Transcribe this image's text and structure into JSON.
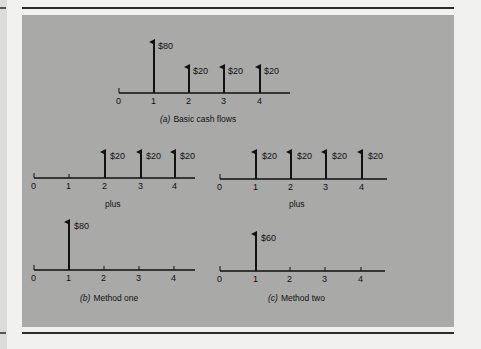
{
  "colors": {
    "panel": "#a9a9a8",
    "ink": "#111111",
    "page": "#f1f1f0"
  },
  "diagrams": [
    {
      "id": "a",
      "caption_prefix": "(a)",
      "caption": "Basic cash flows",
      "ticks": [
        "0",
        "1",
        "2",
        "3",
        "4"
      ],
      "flows": [
        {
          "period": 1,
          "label": "$80"
        },
        {
          "period": 2,
          "label": "$20"
        },
        {
          "period": 3,
          "label": "$20"
        },
        {
          "period": 4,
          "label": "$20"
        }
      ]
    },
    {
      "id": "b_top",
      "caption": "plus",
      "ticks": [
        "0",
        "1",
        "2",
        "3",
        "4"
      ],
      "flows": [
        {
          "period": 2,
          "label": "$20"
        },
        {
          "period": 3,
          "label": "$20"
        },
        {
          "period": 4,
          "label": "$20"
        }
      ]
    },
    {
      "id": "c_top",
      "caption": "plus",
      "ticks": [
        "0",
        "1",
        "2",
        "3",
        "4"
      ],
      "flows": [
        {
          "period": 1,
          "label": "$20"
        },
        {
          "period": 2,
          "label": "$20"
        },
        {
          "period": 3,
          "label": "$20"
        },
        {
          "period": 4,
          "label": "$20"
        }
      ]
    },
    {
      "id": "b_bottom",
      "caption_prefix": "(b)",
      "caption": "Method one",
      "ticks": [
        "0",
        "1",
        "2",
        "3",
        "4"
      ],
      "flows": [
        {
          "period": 1,
          "label": "$80"
        }
      ]
    },
    {
      "id": "c_bottom",
      "caption_prefix": "(c)",
      "caption": "Method two",
      "ticks": [
        "0",
        "1",
        "2",
        "3",
        "4"
      ],
      "flows": [
        {
          "period": 1,
          "label": "$60"
        }
      ]
    }
  ]
}
